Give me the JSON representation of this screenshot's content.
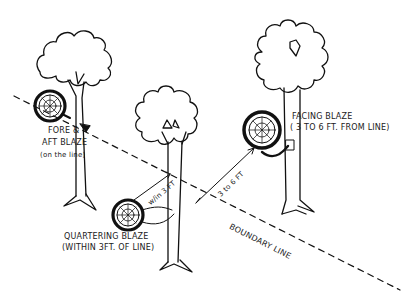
{
  "diagram": {
    "colors": {
      "ink": "#111111",
      "background": "#ffffff"
    },
    "trees": [
      {
        "id": "left-tree",
        "label_line1": "FORE &",
        "label_line2": "AFT BLAZE",
        "label_line3": "(on the line)"
      },
      {
        "id": "center-tree",
        "label_line1": "QUARTERING BLAZE",
        "label_line2": "(WITHIN 3FT. OF LINE)"
      },
      {
        "id": "right-tree",
        "label_line1": "FACING BLAZE",
        "label_line2": "( 3 TO 6 FT. FROM LINE)"
      }
    ],
    "measurements": {
      "within": "w/in 3 FT",
      "range": "3 to 6 FT"
    },
    "boundary_label": "BOUNDARY LINE"
  }
}
